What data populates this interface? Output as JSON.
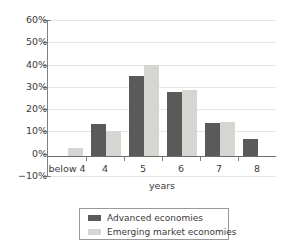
{
  "chart_data": {
    "type": "bar",
    "title": "",
    "xlabel": "years",
    "ylabel": "",
    "categories": [
      "below 4",
      "4",
      "5",
      "6",
      "7",
      "8"
    ],
    "series": [
      {
        "name": "Advanced economies",
        "color": "#5a5a5a",
        "values": [
          0,
          14.5,
          36,
          28.8,
          14.6,
          7.5
        ]
      },
      {
        "name": "Emerging market economies",
        "color": "#d5d5d1",
        "values": [
          3.5,
          11.2,
          40.7,
          29.6,
          15.2,
          0
        ]
      }
    ],
    "ylim": [
      -10,
      60
    ],
    "ytick_values": [
      60,
      50,
      40,
      30,
      20,
      10,
      0,
      -10
    ],
    "ytick_labels": [
      "60%",
      "50%",
      "40%",
      "30%",
      "20%",
      "10%",
      "0%",
      "−10%"
    ],
    "grid": true,
    "legend_position": "bottom"
  }
}
